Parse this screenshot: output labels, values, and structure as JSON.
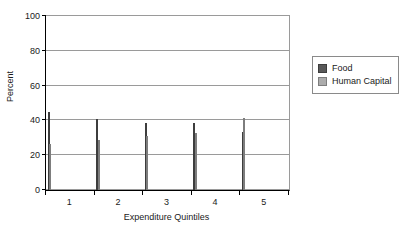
{
  "chart_data": {
    "type": "bar",
    "title": "",
    "xlabel": "Expenditure Quintiles",
    "ylabel": "Percent",
    "categories": [
      "1",
      "2",
      "3",
      "4",
      "5"
    ],
    "series": [
      {
        "name": "Food",
        "color": "#585858",
        "values": [
          44.8,
          40.7,
          38.8,
          38.8,
          33.5
        ]
      },
      {
        "name": "Human Capital",
        "color": "#acacac",
        "values": [
          26.2,
          28.5,
          31.2,
          32.5,
          41.2
        ]
      }
    ],
    "ylim": [
      0,
      100
    ],
    "yticks": [
      0,
      20,
      40,
      60,
      80,
      100
    ],
    "ytick_labels": [
      "0",
      "20",
      "40",
      "60",
      "80",
      "100"
    ],
    "grid": true,
    "grid_axis": "y",
    "legend_position": "right",
    "legend_entries": [
      "Food",
      "Human Capital"
    ]
  }
}
